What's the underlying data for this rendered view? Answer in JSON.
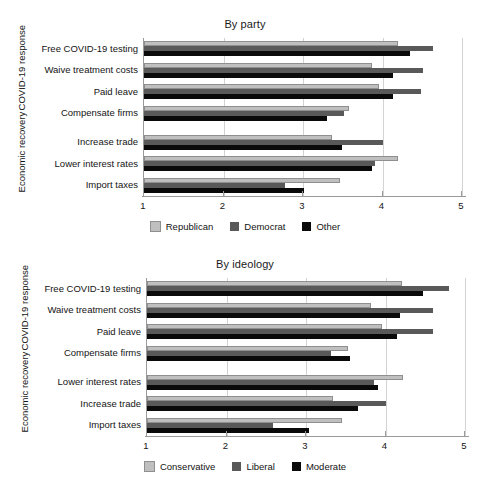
{
  "figure": {
    "axis_min": 1,
    "axis_max": 5,
    "tick_labels": [
      "1",
      "2",
      "3",
      "4",
      "5"
    ],
    "section_labels": [
      "COVID-19 response",
      "Economic recovery"
    ],
    "colors": {
      "series_light": "#bfbfbf",
      "series_medium": "#595959",
      "series_dark": "#0a0a0a",
      "gridline": "#d3d3d3",
      "axis": "#9a9a9a",
      "text": "#141414",
      "background": "#ffffff"
    }
  },
  "chart_data": [
    {
      "type": "bar",
      "orientation": "horizontal",
      "title": "By party",
      "xlabel": "",
      "ylabel": "",
      "xlim": [
        1,
        5
      ],
      "xticks": [
        1,
        2,
        3,
        4,
        5
      ],
      "grid": true,
      "legend_position": "bottom",
      "sections": [
        {
          "label": "COVID-19 response",
          "categories": [
            "Free COVID-19 testing",
            "Waive treatment costs",
            "Paid leave",
            "Compensate firms"
          ]
        },
        {
          "label": "Economic recovery",
          "categories": [
            "Increase trade",
            "Lower interest rates",
            "Import taxes"
          ]
        }
      ],
      "categories": [
        "Free COVID-19 testing",
        "Waive treatment costs",
        "Paid leave",
        "Compensate firms",
        "Increase trade",
        "Lower interest rates",
        "Import taxes"
      ],
      "series": [
        {
          "name": "Republican",
          "color": "#bfbfbf",
          "values": [
            4.19,
            3.87,
            3.96,
            3.58,
            3.37,
            4.19,
            3.47
          ]
        },
        {
          "name": "Democrat",
          "color": "#595959",
          "values": [
            4.63,
            4.51,
            4.48,
            3.52,
            4.0,
            3.91,
            2.77
          ]
        },
        {
          "name": "Other",
          "color": "#0a0a0a",
          "values": [
            4.34,
            4.13,
            4.13,
            3.3,
            3.49,
            3.87,
            3.01
          ]
        }
      ]
    },
    {
      "type": "bar",
      "orientation": "horizontal",
      "title": "By ideology",
      "xlabel": "",
      "ylabel": "",
      "xlim": [
        1,
        5
      ],
      "xticks": [
        1,
        2,
        3,
        4,
        5
      ],
      "grid": true,
      "legend_position": "bottom",
      "sections": [
        {
          "label": "COVID-19 response",
          "categories": [
            "Free COVID-19 testing",
            "Waive treatment costs",
            "Paid leave",
            "Compensate firms"
          ]
        },
        {
          "label": "Economic recovery",
          "categories": [
            "Lower interest rates",
            "Increase trade",
            "Import taxes"
          ]
        }
      ],
      "categories": [
        "Free COVID-19 testing",
        "Waive treatment costs",
        "Paid leave",
        "Compensate firms",
        "Lower interest rates",
        "Increase trade",
        "Import taxes"
      ],
      "series": [
        {
          "name": "Conservative",
          "color": "#bfbfbf",
          "values": [
            4.21,
            3.82,
            3.95,
            3.53,
            4.22,
            3.34,
            3.45
          ]
        },
        {
          "name": "Liberal",
          "color": "#595959",
          "values": [
            4.8,
            4.6,
            4.6,
            3.31,
            3.86,
            4.01,
            2.58
          ]
        },
        {
          "name": "Moderate",
          "color": "#0a0a0a",
          "values": [
            4.47,
            4.18,
            4.14,
            3.55,
            3.91,
            3.65,
            3.04
          ]
        }
      ]
    }
  ]
}
